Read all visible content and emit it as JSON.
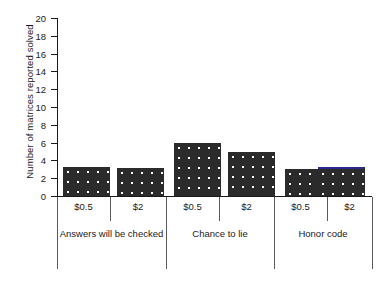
{
  "chart_data": {
    "type": "bar",
    "title": "",
    "xlabel": "",
    "ylabel": "Number of matrices reported solved",
    "ylim": [
      0,
      20
    ],
    "ytick_step": 2,
    "yticks": [
      20,
      18,
      16,
      14,
      12,
      10,
      8,
      6,
      4,
      2,
      0
    ],
    "grid": false,
    "legend": null,
    "categories": [
      "$0.5",
      "$2",
      "$0.5",
      "$2",
      "$0.5",
      "$2"
    ],
    "values": [
      3.3,
      3.1,
      6.0,
      4.9,
      3.0,
      3.0
    ],
    "groups": [
      {
        "label": "Answers will be checked",
        "bars": [
          {
            "category": "$0.5",
            "value": 3.3
          },
          {
            "category": "$2",
            "value": 3.1
          }
        ]
      },
      {
        "label": "Chance to lie",
        "bars": [
          {
            "category": "$0.5",
            "value": 6.0
          },
          {
            "category": "$2",
            "value": 4.9
          }
        ]
      },
      {
        "label": "Honor code",
        "bars": [
          {
            "category": "$0.5",
            "value": 3.0
          },
          {
            "category": "$2",
            "value": 3.0
          }
        ]
      }
    ],
    "colors": {
      "bar_fill": "#2b2b2b",
      "bar_pattern": "#ffffff",
      "highlight_cap": "#2a2a8c",
      "axis": "#1a1a1a",
      "separator": "#5a5a5a",
      "background": "#ffffff"
    }
  }
}
